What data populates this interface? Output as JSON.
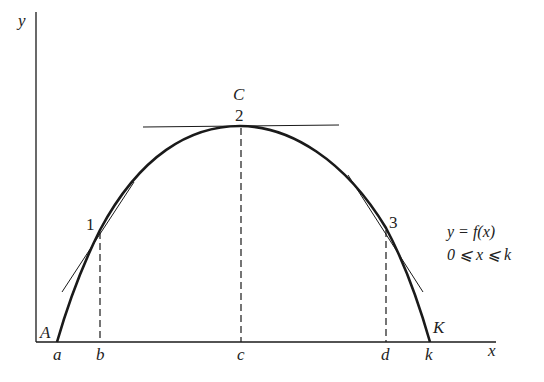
{
  "axes": {
    "x_label": "x",
    "y_label": "y"
  },
  "curve": {
    "start_label": "A",
    "end_label": "K",
    "peak_label": "C"
  },
  "points": [
    {
      "id": "1",
      "label": "1"
    },
    {
      "id": "2",
      "label": "2"
    },
    {
      "id": "3",
      "label": "3"
    }
  ],
  "x_ticks": [
    "a",
    "b",
    "c",
    "d",
    "k"
  ],
  "equation": {
    "line1": "y = f(x)",
    "line2": "0 ⩽ x ⩽ k"
  },
  "colors": {
    "stroke": "#1a1a1a",
    "background": "#ffffff"
  }
}
